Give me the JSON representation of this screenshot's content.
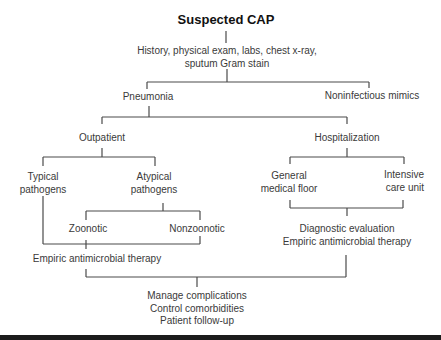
{
  "diagram": {
    "title": "Suspected CAP",
    "workup": {
      "line1": "History, physical exam, labs, chest x-ray,",
      "line2": "sputum Gram stain"
    },
    "level2": {
      "pneumonia": "Pneumonia",
      "mimics": "Noninfectious mimics"
    },
    "level3": {
      "outpatient": "Outpatient",
      "hospitalization": "Hospitalization"
    },
    "outpatient_branch": {
      "typical": {
        "line1": "Typical",
        "line2": "pathogens"
      },
      "atypical": {
        "line1": "Atypical",
        "line2": "pathogens"
      },
      "zoonotic": "Zoonotic",
      "nonzoonotic": "Nonzoonotic",
      "therapy": "Empiric antimicrobial therapy"
    },
    "hospital_branch": {
      "general": {
        "line1": "General",
        "line2": "medical floor"
      },
      "icu": {
        "line1": "Intensive",
        "line2": "care unit"
      },
      "evaluation": {
        "line1": "Diagnostic evaluation",
        "line2": "Empiric antimicrobial therapy"
      }
    },
    "final": {
      "line1": "Manage complications",
      "line2": "Control comorbidities",
      "line3": "Patient follow-up"
    },
    "colors": {
      "line": "#4a4a4a",
      "text": "#3a3a3a",
      "title": "#111111",
      "bar": "#1c1c1c"
    }
  }
}
